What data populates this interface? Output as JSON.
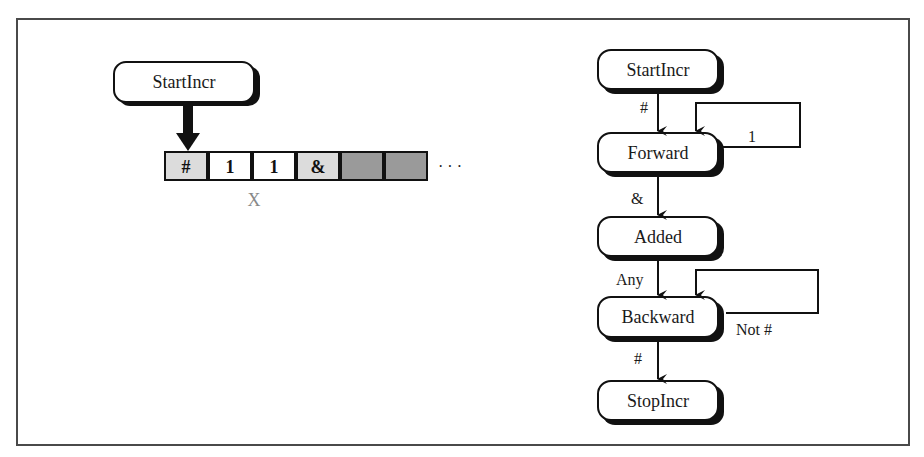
{
  "left": {
    "head_node": {
      "label": "StartIncr"
    },
    "tape": {
      "cells": [
        {
          "label": "#",
          "fill": "#dcdcdc"
        },
        {
          "label": "1",
          "fill": "#ffffff"
        },
        {
          "label": "1",
          "fill": "#ffffff"
        },
        {
          "label": "&",
          "fill": "#dcdcdc"
        },
        {
          "label": "",
          "fill": "#9a9a9a"
        },
        {
          "label": "",
          "fill": "#9a9a9a"
        }
      ],
      "ellipsis": "· · ·",
      "under_label": "X"
    }
  },
  "right": {
    "nodes": [
      {
        "id": "start",
        "label": "StartIncr"
      },
      {
        "id": "forward",
        "label": "Forward"
      },
      {
        "id": "added",
        "label": "Added"
      },
      {
        "id": "backward",
        "label": "Backward"
      },
      {
        "id": "stop",
        "label": "StopIncr"
      }
    ],
    "edges": [
      {
        "from": "StartIncr",
        "to": "Forward",
        "label": "#"
      },
      {
        "from": "Forward",
        "to": "Forward",
        "label": "1"
      },
      {
        "from": "Forward",
        "to": "Added",
        "label": "&"
      },
      {
        "from": "Added",
        "to": "Backward",
        "label": "Any"
      },
      {
        "from": "Backward",
        "to": "Backward",
        "label": "Not #"
      },
      {
        "from": "Backward",
        "to": "StopIncr",
        "label": "#"
      }
    ]
  }
}
